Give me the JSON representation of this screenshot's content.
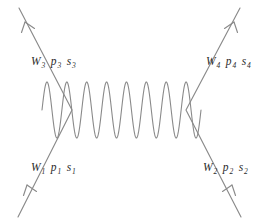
{
  "diagram": {
    "type": "feynman-diagram",
    "title": "",
    "background_color": "#ffffff",
    "line_color": "#8a8a8a",
    "text_color": "#2b2b2b",
    "labels": {
      "top_left": {
        "symbol": "W",
        "symbol_sub": "3",
        "momentum": "p",
        "momentum_sub": "3",
        "spin": "s",
        "spin_sub": "3",
        "text": "W3 p3 s3"
      },
      "top_right": {
        "symbol": "W",
        "symbol_sub": "4",
        "momentum": "p",
        "momentum_sub": "4",
        "spin": "s",
        "spin_sub": "4",
        "text": "W4 p4 s4"
      },
      "bottom_left": {
        "symbol": "W",
        "symbol_sub": "1",
        "momentum": "p",
        "momentum_sub": "1",
        "spin": "s",
        "spin_sub": "1",
        "text": "W1 p1 s1"
      },
      "bottom_right": {
        "symbol": "W",
        "symbol_sub": "2",
        "momentum": "p",
        "momentum_sub": "2",
        "spin": "s",
        "spin_sub": "2",
        "text": "W2 p2 s2"
      }
    },
    "propagator": {
      "style": "sinusoidal-wave",
      "cycles": 8,
      "amplitude": 28,
      "x_start": 42,
      "x_end": 201,
      "y_center": 110
    },
    "legs": [
      {
        "name": "incoming-left",
        "from": [
          18,
          216
        ],
        "to": [
          72,
          110
        ],
        "arrow": "up-right"
      },
      {
        "name": "outgoing-left",
        "from": [
          72,
          110
        ],
        "to": [
          19,
          9
        ],
        "arrow": "up-left"
      },
      {
        "name": "incoming-right",
        "from": [
          241,
          216
        ],
        "to": [
          186,
          110
        ],
        "arrow": "up-left"
      },
      {
        "name": "outgoing-right",
        "from": [
          186,
          110
        ],
        "to": [
          240,
          9
        ],
        "arrow": "up-right"
      }
    ]
  }
}
